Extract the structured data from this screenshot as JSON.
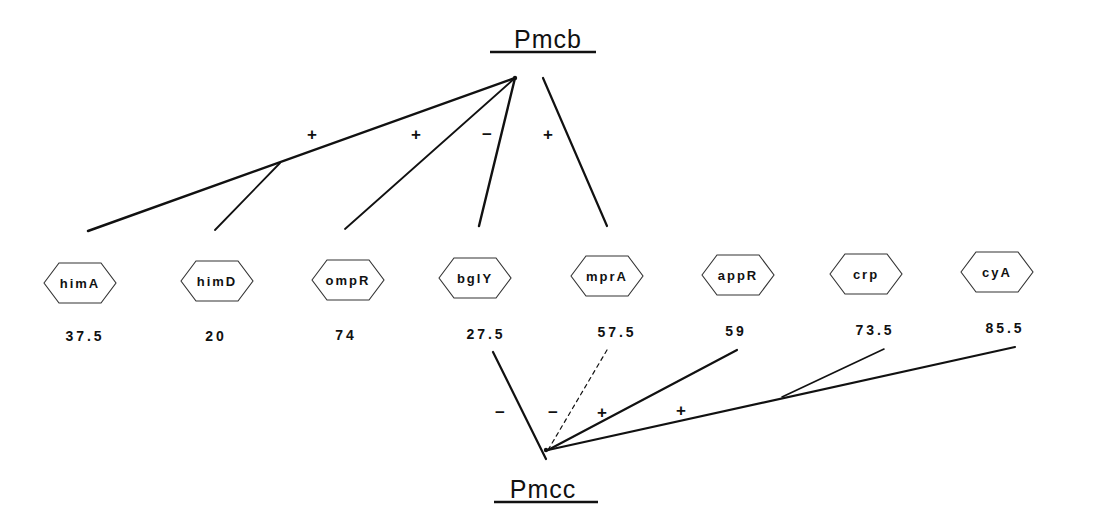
{
  "promoters": {
    "top": {
      "label": "Pmcb",
      "x": 548,
      "y": 48,
      "underline": [
        490,
        596,
        52
      ],
      "hub": [
        515,
        78
      ]
    },
    "bottom": {
      "label": "Pmcc",
      "x": 543,
      "y": 498,
      "underline": [
        494,
        598,
        502
      ],
      "hub": [
        546,
        450
      ]
    }
  },
  "genes": [
    {
      "name": "himA",
      "cx": 80,
      "cy": 283,
      "position": "37.5",
      "px": 85,
      "py": 341
    },
    {
      "name": "himD",
      "cx": 217,
      "cy": 281,
      "position": "20",
      "px": 216,
      "py": 341
    },
    {
      "name": "ompR",
      "cx": 348,
      "cy": 280,
      "position": "74",
      "px": 346,
      "py": 340
    },
    {
      "name": "bglY",
      "cx": 475,
      "cy": 278,
      "position": "27.5",
      "px": 486,
      "py": 339
    },
    {
      "name": "mprA",
      "cx": 607,
      "cy": 276,
      "position": "57.5",
      "px": 617,
      "py": 337
    },
    {
      "name": "appR",
      "cx": 738,
      "cy": 275,
      "position": "59",
      "px": 736,
      "py": 336
    },
    {
      "name": "crp",
      "cx": 866,
      "cy": 274,
      "position": "73.5",
      "px": 875,
      "py": 335
    },
    {
      "name": "cyA",
      "cx": 997,
      "cy": 272,
      "position": "85.5",
      "px": 1005,
      "py": 333
    }
  ],
  "edges": [
    {
      "id": "himA-Pmcb",
      "x1": 88,
      "y1": 231,
      "x2": 515,
      "y2": 78,
      "style": "solid",
      "width": 2.4
    },
    {
      "id": "himD-branch",
      "x1": 215,
      "y1": 230,
      "x2": 280,
      "y2": 163,
      "style": "solid",
      "width": 1.8
    },
    {
      "id": "ompR-Pmcb",
      "x1": 345,
      "y1": 229,
      "x2": 515,
      "y2": 78,
      "style": "solid",
      "width": 1.8
    },
    {
      "id": "bglY-Pmcb",
      "x1": 479,
      "y1": 226,
      "x2": 515,
      "y2": 78,
      "style": "solid",
      "width": 2.4
    },
    {
      "id": "mprA-Pmcb",
      "x1": 607,
      "y1": 226,
      "x2": 543,
      "y2": 78,
      "style": "solid",
      "width": 2.2
    },
    {
      "id": "bglY-Pmcc",
      "x1": 493,
      "y1": 352,
      "x2": 546,
      "y2": 459,
      "style": "solid",
      "width": 2.2
    },
    {
      "id": "mprA-Pmcc",
      "x1": 607,
      "y1": 350,
      "x2": 548,
      "y2": 450,
      "style": "dashed",
      "width": 1.2
    },
    {
      "id": "appR-Pmcc",
      "x1": 737,
      "y1": 350,
      "x2": 548,
      "y2": 450,
      "style": "solid",
      "width": 2.2
    },
    {
      "id": "cyA-Pmcc",
      "x1": 1015,
      "y1": 347,
      "x2": 548,
      "y2": 450,
      "style": "solid",
      "width": 2.2
    },
    {
      "id": "crp-branch",
      "x1": 884,
      "y1": 349,
      "x2": 782,
      "y2": 397,
      "style": "solid",
      "width": 1.6
    }
  ],
  "signs": [
    {
      "text": "+",
      "x": 312,
      "y": 140
    },
    {
      "text": "+",
      "x": 416,
      "y": 140
    },
    {
      "text": "−",
      "x": 487,
      "y": 140
    },
    {
      "text": "+",
      "x": 548,
      "y": 140
    },
    {
      "text": "−",
      "x": 500,
      "y": 418
    },
    {
      "text": "−",
      "x": 553,
      "y": 418
    },
    {
      "text": "+",
      "x": 602,
      "y": 418
    },
    {
      "text": "+",
      "x": 681,
      "y": 416
    }
  ],
  "colors": {
    "ink": "#111111",
    "background": "#ffffff"
  }
}
